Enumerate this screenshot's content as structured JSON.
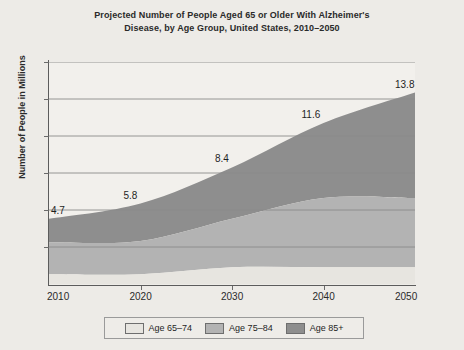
{
  "chart_data": {
    "type": "area",
    "stacked": true,
    "title": "Projected Number of People Aged 65 or Older With Alzheimer's Disease, by Age Group, United States, 2010–2050",
    "title_line1": "Projected Number of People Aged 65 or Older With Alzheimer's",
    "title_line2": "Disease, by Age Group, United States, 2010–2050",
    "xlabel": "",
    "ylabel": "Number of People in Millions",
    "x": [
      2010,
      2020,
      2030,
      2040,
      2050
    ],
    "categories": [
      "2010",
      "2020",
      "2030",
      "2040",
      "2050"
    ],
    "xlim": [
      2010,
      2050
    ],
    "ylim": [
      0,
      16
    ],
    "grid": true,
    "y_tick_count": 6,
    "y_ticks_labeled": false,
    "legend_position": "bottom",
    "series": [
      {
        "name": "Age 65–74",
        "color": "#e7e5e0",
        "values": [
          0.7,
          0.7,
          1.2,
          1.2,
          1.2
        ]
      },
      {
        "name": "Age 75–84",
        "color": "#b3b3b3",
        "values": [
          2.3,
          2.4,
          3.5,
          5.0,
          5.0
        ]
      },
      {
        "name": "Age 85+",
        "color": "#8e8e8e",
        "values": [
          1.7,
          2.7,
          3.7,
          5.4,
          7.6
        ]
      }
    ],
    "totals": [
      4.7,
      5.8,
      8.4,
      11.6,
      13.8
    ],
    "data_labels": [
      {
        "text": "4.7",
        "x": 2010,
        "value": 4.7
      },
      {
        "text": "5.8",
        "x": 2020,
        "value": 5.8
      },
      {
        "text": "8.4",
        "x": 2030,
        "value": 8.4
      },
      {
        "text": "11.6",
        "x": 2040,
        "value": 11.6
      },
      {
        "text": "13.8",
        "x": 2050,
        "value": 13.8
      }
    ],
    "legend": [
      {
        "label": "Age 65–74",
        "color": "#e7e5e0"
      },
      {
        "label": "Age 75–84",
        "color": "#b3b3b3"
      },
      {
        "label": "Age 85+",
        "color": "#8e8e8e"
      }
    ],
    "colors": {
      "background": "#edebe7",
      "plot_background": "#f2f0ec",
      "axis": "#5c5c5c",
      "gridline": "#8a8a8a",
      "text": "#2a2a2a"
    }
  }
}
